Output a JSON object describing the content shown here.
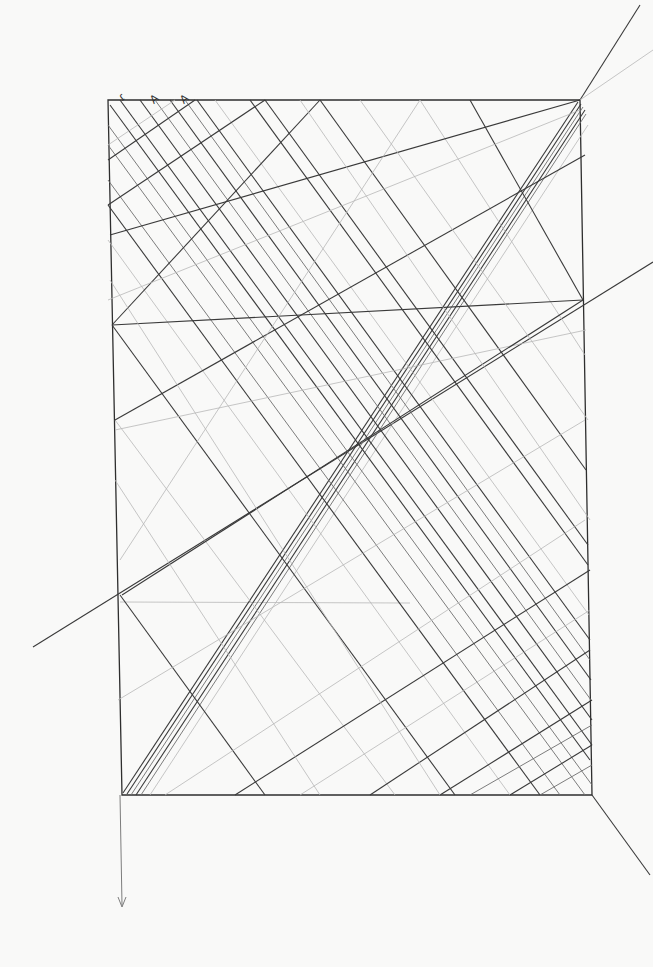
{
  "drawing": {
    "title": "",
    "corner_labels": [
      "ɾ",
      "A",
      "A"
    ],
    "background": "#f9f9f8",
    "stroke_dark": "#3a3a3a",
    "stroke_light": "#b8b8b8",
    "frame": {
      "tl": [
        108,
        100
      ],
      "tr": [
        580,
        100
      ],
      "br": [
        592,
        795
      ],
      "bl": [
        122,
        795
      ]
    }
  }
}
